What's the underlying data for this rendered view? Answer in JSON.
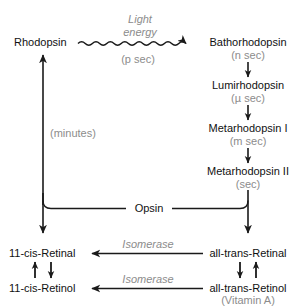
{
  "diagram": {
    "colors": {
      "background": "#ffffff",
      "text": "#111111",
      "annotation": "#8c8c8c",
      "stroke": "#1a1a1a"
    },
    "nodes": {
      "rhodopsin": "Rhodopsin",
      "bathorhodopsin": "Bathorhodopsin",
      "lumirhodopsin": "Lumirhodopsin",
      "metarhodopsin_i": "Metarhodopsin I",
      "metarhodopsin_ii": "Metarhodopsin II",
      "opsin": "Opsin",
      "cis_retinal": "11-cis-Retinal",
      "cis_retinol": "11-cis-Retinol",
      "trans_retinal": "all-trans-Retinal",
      "trans_retinol": "all-trans-Retinol",
      "vitamin_a": "(Vitamin A)"
    },
    "annotations": {
      "light_energy_line1": "Light",
      "light_energy_line2": "energy",
      "p_sec": "(p sec)",
      "n_sec": "(n sec)",
      "mu_sec": "(µ sec)",
      "m_sec": "(m sec)",
      "sec": "(sec)",
      "minutes": "(minutes)",
      "isomerase_top": "Isomerase",
      "isomerase_bottom": "Isomerase"
    },
    "edges": [
      {
        "name": "rhodopsin-to-bathorhodopsin",
        "style": "wavy-arrow",
        "label": "Light energy",
        "timing": "(p sec)"
      },
      {
        "name": "bathorhodopsin-to-lumirhodopsin",
        "style": "arrow-down",
        "timing": "(n sec)"
      },
      {
        "name": "lumirhodopsin-to-metarhodopsin-i",
        "style": "arrow-down",
        "timing": "(µ sec)"
      },
      {
        "name": "metarhodopsin-i-to-metarhodopsin-ii",
        "style": "arrow-down",
        "timing": "(m sec)"
      },
      {
        "name": "metarhodopsin-ii-to-trans-retinal",
        "style": "arrow-down",
        "timing": "(sec)"
      },
      {
        "name": "opsin-to-cis-retinal",
        "style": "arrow-down"
      },
      {
        "name": "cis-retinal-to-rhodopsin",
        "style": "arrow-up",
        "timing": "(minutes)"
      },
      {
        "name": "trans-retinal-to-cis-retinal",
        "style": "arrow-left",
        "label": "Isomerase"
      },
      {
        "name": "trans-retinol-to-cis-retinol",
        "style": "arrow-left",
        "label": "Isomerase"
      },
      {
        "name": "cis-retinol-to-cis-retinal",
        "style": "arrow-up"
      },
      {
        "name": "cis-retinal-to-cis-retinol",
        "style": "arrow-down"
      },
      {
        "name": "trans-retinal-to-trans-retinol",
        "style": "arrow-down"
      },
      {
        "name": "trans-retinol-to-trans-retinal",
        "style": "arrow-up"
      }
    ]
  }
}
